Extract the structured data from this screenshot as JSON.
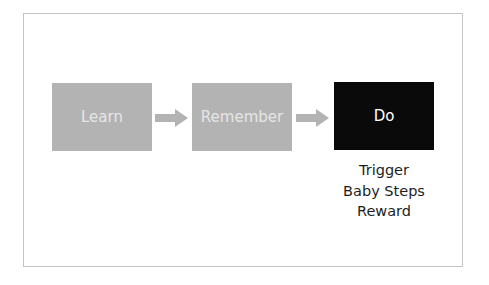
{
  "diagram": {
    "steps": [
      {
        "label": "Learn",
        "style": "gray"
      },
      {
        "label": "Remember",
        "style": "gray"
      },
      {
        "label": "Do",
        "style": "dark"
      }
    ],
    "do_details": [
      "Trigger",
      "Baby Steps",
      "Reward"
    ],
    "colors": {
      "gray_box": "#b3b3b3",
      "dark_box": "#0a0a0a",
      "arrow": "#b3b3b3",
      "frame_border": "#c4c4c4"
    }
  }
}
